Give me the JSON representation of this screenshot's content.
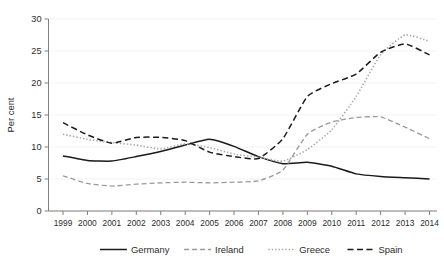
{
  "chart_data": {
    "type": "line",
    "title": "",
    "subtitle": "",
    "xlabel": "",
    "ylabel": "Per cent",
    "xlim": [
      1999,
      2014
    ],
    "ylim": [
      0,
      30
    ],
    "yticks": [
      0,
      5,
      10,
      15,
      20,
      25,
      30
    ],
    "ytick_labels": [
      "0",
      "5",
      "10",
      "15",
      "20",
      "25",
      "30"
    ],
    "grid": "horizontal-only, very light gray",
    "legend_position": "bottom-center, horizontal, no frame",
    "categories": [
      1999,
      2000,
      2001,
      2002,
      2003,
      2004,
      2005,
      2006,
      2007,
      2008,
      2009,
      2010,
      2011,
      2012,
      2013,
      2014
    ],
    "xtick_labels": [
      "1999",
      "2000",
      "2001",
      "2002",
      "2003",
      "2004",
      "2005",
      "2006",
      "2007",
      "2008",
      "2009",
      "2010",
      "2011",
      "2012",
      "2013",
      "2014"
    ],
    "series": [
      {
        "name": "Germany",
        "color": "#1a1a1a",
        "style": "solid",
        "dasharray": "none",
        "width": 1.5,
        "values": [
          8.6,
          7.9,
          7.8,
          8.5,
          9.3,
          10.3,
          11.2,
          10.1,
          8.5,
          7.4,
          7.6,
          7.0,
          5.8,
          5.4,
          5.2,
          5.0
        ]
      },
      {
        "name": "Ireland",
        "color": "#9a9a9a",
        "style": "dashed",
        "dasharray": "5,3",
        "width": 1.3,
        "values": [
          5.5,
          4.3,
          3.9,
          4.2,
          4.4,
          4.5,
          4.4,
          4.5,
          4.7,
          6.4,
          12.0,
          13.9,
          14.6,
          14.7,
          13.1,
          11.3
        ]
      },
      {
        "name": "Greece",
        "color": "#a8a8a8",
        "style": "dotted",
        "dasharray": "1.4,2.0",
        "width": 1.6,
        "values": [
          12.0,
          11.2,
          10.7,
          10.3,
          9.7,
          10.5,
          9.9,
          8.9,
          8.4,
          7.8,
          9.6,
          12.7,
          17.9,
          24.4,
          27.5,
          26.5
        ]
      },
      {
        "name": "Spain",
        "color": "#1a1a1a",
        "style": "dashed",
        "dasharray": "6,3.5",
        "width": 1.5,
        "values": [
          13.8,
          11.9,
          10.6,
          11.5,
          11.5,
          11.0,
          9.2,
          8.5,
          8.2,
          11.3,
          17.9,
          19.9,
          21.4,
          24.8,
          26.1,
          24.4
        ]
      }
    ]
  },
  "axes": {
    "ylabel": "Per cent"
  },
  "legend": {
    "items": [
      {
        "label": "Germany"
      },
      {
        "label": "Ireland"
      },
      {
        "label": "Greece"
      },
      {
        "label": "Spain"
      }
    ]
  }
}
